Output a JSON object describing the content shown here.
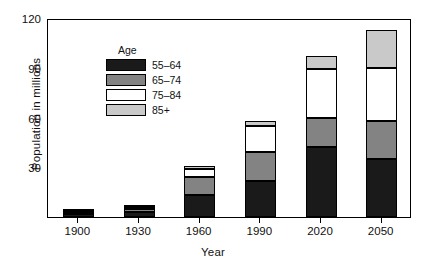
{
  "chart_data": {
    "type": "bar",
    "stacked": true,
    "title": "",
    "xlabel": "Year",
    "ylabel": "Population in millions",
    "categories": [
      "1900",
      "1930",
      "1960",
      "1990",
      "2020",
      "2050"
    ],
    "ylim": [
      0,
      120
    ],
    "yticks": [
      30,
      60,
      90,
      120
    ],
    "grid": false,
    "legend_title": "Age",
    "legend_position": "top-left inside",
    "series": [
      {
        "name": "55–64",
        "color": "#1a1a1a",
        "values": [
          2,
          3,
          13,
          22,
          42,
          35
        ]
      },
      {
        "name": "65–74",
        "color": "#838383",
        "values": [
          1,
          2,
          11,
          17,
          18,
          23
        ]
      },
      {
        "name": "75–84",
        "color": "#ffffff",
        "values": [
          0.5,
          1,
          5,
          16,
          29,
          32
        ]
      },
      {
        "name": "85+",
        "color": "#c9c9c9",
        "values": [
          0.2,
          0.4,
          1.5,
          3,
          8,
          23
        ]
      }
    ],
    "totals": [
      3.7,
      6.4,
      30.5,
      58,
      97,
      113
    ]
  },
  "legend": {
    "title": "Age",
    "items": [
      {
        "label": "55–64"
      },
      {
        "label": "65–74"
      },
      {
        "label": "75–84"
      },
      {
        "label": "85+"
      }
    ]
  },
  "axes": {
    "ylabel": "Population in millions",
    "xlabel": "Year"
  }
}
